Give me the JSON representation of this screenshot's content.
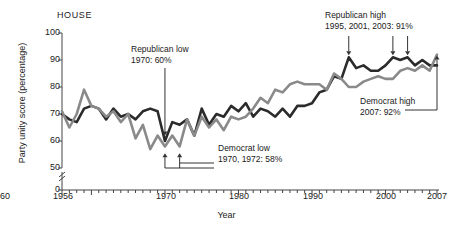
{
  "chart_data": {
    "type": "line",
    "title": "HOUSE",
    "xlabel": "Year",
    "ylabel": "Party unity score (percentage)",
    "xlim": [
      1956,
      2007
    ],
    "ylim": [
      50,
      100
    ],
    "yticks": [
      0,
      50,
      60,
      70,
      80,
      90,
      100
    ],
    "y_axis_break": true,
    "xticks": [
      1956,
      1960,
      1970,
      1980,
      1990,
      2000,
      2007
    ],
    "grid": false,
    "legend": "none",
    "x": [
      1956,
      1957,
      1958,
      1959,
      1960,
      1961,
      1962,
      1963,
      1964,
      1965,
      1966,
      1967,
      1968,
      1969,
      1970,
      1971,
      1972,
      1973,
      1974,
      1975,
      1976,
      1977,
      1978,
      1979,
      1980,
      1981,
      1982,
      1983,
      1984,
      1985,
      1986,
      1987,
      1988,
      1989,
      1990,
      1991,
      1992,
      1993,
      1994,
      1995,
      1996,
      1997,
      1998,
      1999,
      2000,
      2001,
      2002,
      2003,
      2004,
      2005,
      2006,
      2007
    ],
    "series": [
      {
        "name": "Republican",
        "color": "#2b2b2b",
        "values": [
          70,
          68,
          67,
          72,
          73,
          72,
          68,
          72,
          69,
          70,
          68,
          71,
          72,
          71,
          60,
          67,
          66,
          68,
          62,
          72,
          66,
          70,
          69,
          73,
          71,
          74,
          69,
          72,
          71,
          69,
          72,
          69,
          73,
          73,
          74,
          78,
          79,
          84,
          83,
          91,
          87,
          88,
          86,
          86,
          88,
          91,
          90,
          91,
          88,
          90,
          88,
          88
        ]
      },
      {
        "name": "Democrat",
        "color": "#8a8a8a",
        "values": [
          71,
          65,
          70,
          79,
          73,
          72,
          69,
          71,
          67,
          70,
          61,
          66,
          57,
          62,
          58,
          62,
          58,
          68,
          62,
          69,
          65,
          68,
          64,
          69,
          68,
          69,
          72,
          76,
          74,
          79,
          78,
          81,
          82,
          81,
          81,
          81,
          79,
          85,
          83,
          80,
          80,
          82,
          83,
          84,
          83,
          83,
          86,
          87,
          86,
          88,
          86,
          92
        ]
      }
    ],
    "annotations": [
      {
        "id": "rep-low",
        "line1": "Republican low",
        "line2": "1970: 60%"
      },
      {
        "id": "dem-low",
        "line1": "Democrat low",
        "line2": "1970, 1972: 58%"
      },
      {
        "id": "rep-high",
        "line1": "Republican high",
        "line2": "1995, 2001, 2003: 91%"
      },
      {
        "id": "dem-high",
        "line1": "Democrat high",
        "line2": "2007: 92%"
      }
    ]
  }
}
